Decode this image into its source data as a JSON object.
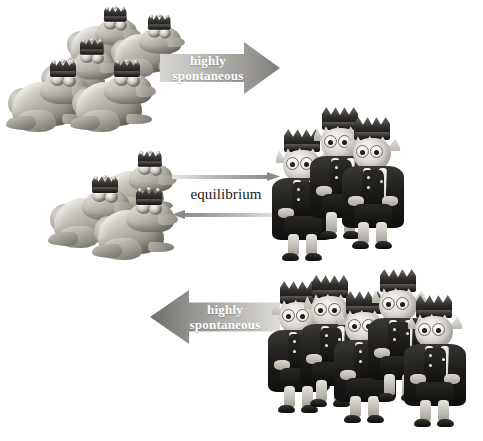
{
  "figure": {
    "background_color": "#ffffff",
    "palette": {
      "arrow_light": "#d7d6d3",
      "arrow_dark": "#807e7a",
      "arrow_text": "#ffffff",
      "equilibrium_text": "#1b1b1b",
      "thin_arrow": "#8b8985"
    }
  },
  "rows": [
    {
      "id": "row-top",
      "left_species": "frog",
      "left_count": 5,
      "right_species": "prince",
      "right_count": 0,
      "arrow": {
        "type": "block-arrow",
        "direction": "right",
        "label_line1": "highly",
        "label_line2": "spontaneous"
      }
    },
    {
      "id": "row-middle",
      "left_species": "frog",
      "left_count": 3,
      "right_species": "prince",
      "right_count": 3,
      "arrow": {
        "type": "double-arrow",
        "direction": "both",
        "label": "equilibrium"
      }
    },
    {
      "id": "row-bottom",
      "left_species": "frog",
      "left_count": 0,
      "right_species": "prince",
      "right_count": 5,
      "arrow": {
        "type": "block-arrow",
        "direction": "left",
        "label_line1": "highly",
        "label_line2": "spontaneous"
      }
    }
  ],
  "labels": {
    "highly": "highly",
    "spontaneous": "spontaneous",
    "equilibrium": "equilibrium"
  }
}
